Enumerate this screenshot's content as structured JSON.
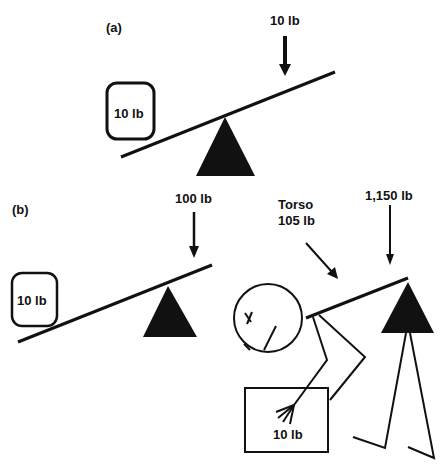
{
  "panel_a": {
    "label": "(a)",
    "force_label": "10 lb",
    "box_label": "10 lb"
  },
  "panel_b": {
    "label": "(b)",
    "force_label": "100 lb",
    "box_label": "10 lb",
    "torso_label_line1": "Torso",
    "torso_label_line2": "105 lb",
    "spine_force_label": "1,150 lb",
    "carried_box_label": "10 lb"
  },
  "colors": {
    "ink": "#111111",
    "background": "#ffffff"
  }
}
